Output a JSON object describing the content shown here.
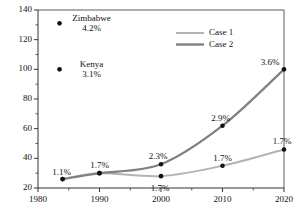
{
  "chart_data": {
    "type": "line",
    "title": "",
    "xlabel": "",
    "ylabel": "",
    "xlim": [
      1980,
      2020
    ],
    "ylim": [
      20,
      140
    ],
    "grid": false,
    "legend_position": "top-right",
    "x": [
      1984,
      1990,
      2000,
      2010,
      2020
    ],
    "xtick_labels": [
      "1980",
      "1990",
      "2000",
      "2010",
      "2020"
    ],
    "xticks": [
      1980,
      1990,
      2000,
      2010,
      2020
    ],
    "ytick_labels": [
      "20",
      "40",
      "60",
      "80",
      "100",
      "120",
      "140"
    ],
    "yticks": [
      20,
      40,
      60,
      80,
      100,
      120,
      140
    ],
    "series": [
      {
        "name": "Case 1",
        "color": "#b3b3b3",
        "values": [
          26,
          30,
          28,
          35,
          46
        ],
        "point_labels": [
          "1.1%",
          "1.7%",
          "1.7%",
          "1.7%",
          "1.7%"
        ]
      },
      {
        "name": "Case 2",
        "color": "#808080",
        "values": [
          26,
          30,
          36,
          62,
          100
        ],
        "point_labels": [
          "1.1%",
          "1.7%",
          "2.3%",
          "2.9%",
          "3.6%"
        ]
      }
    ],
    "annotations": [
      {
        "name": "Zimbabwe",
        "value_label": "4.2%",
        "x": 1983.5,
        "y": 131
      },
      {
        "name": "Kenya",
        "value_label": "3.1%",
        "x": 1983.5,
        "y": 100
      }
    ]
  },
  "legend": {
    "entries": [
      {
        "label": "Case 1"
      },
      {
        "label": "Case 2"
      }
    ]
  },
  "colors": {
    "case1": "#b3b3b3",
    "case2": "#808080",
    "axis": "#333333",
    "marker": "#111111",
    "text": "#111111"
  }
}
